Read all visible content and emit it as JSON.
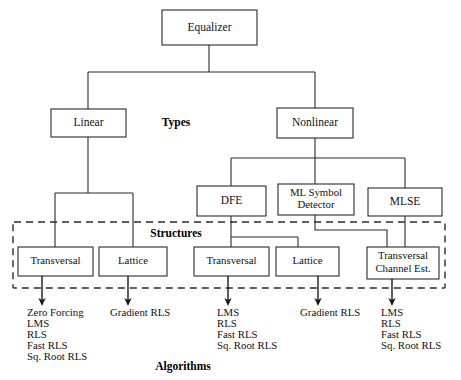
{
  "diagram": {
    "colors": {
      "stroke": "#2b2b2b",
      "text": "#111111",
      "background": "#ffffff"
    },
    "root": {
      "label": "Equalizer"
    },
    "types": {
      "section_label": "Types",
      "nodes": [
        {
          "label": "Linear"
        },
        {
          "label": "Nonlinear"
        }
      ]
    },
    "nonlinear_children": [
      {
        "label": "DFE"
      },
      {
        "label_line1": "ML Symbol",
        "label_line2": "Detector"
      },
      {
        "label": "MLSE"
      }
    ],
    "structures": {
      "section_label": "Structures",
      "nodes": [
        {
          "label": "Transversal"
        },
        {
          "label": "Lattice"
        },
        {
          "label": "Transversal"
        },
        {
          "label": "Lattice"
        },
        {
          "label_line1": "Transversal",
          "label_line2": "Channel Est."
        }
      ]
    },
    "algorithms": {
      "section_label": "Algorithms",
      "columns": [
        {
          "items": [
            "Zero Forcing",
            "LMS",
            "RLS",
            "Fast RLS",
            "Sq. Root RLS"
          ]
        },
        {
          "items": [
            "Gradient RLS"
          ]
        },
        {
          "items": [
            "LMS",
            "RLS",
            "Fast RLS",
            "Sq. Root RLS"
          ]
        },
        {
          "items": [
            "Gradient RLS"
          ]
        },
        {
          "items": [
            "LMS",
            "RLS",
            "Fast RLS",
            "Sq. Root RLS"
          ]
        }
      ]
    }
  }
}
